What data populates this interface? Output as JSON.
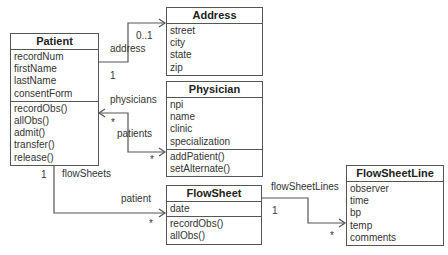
{
  "classes": {
    "patient": {
      "name": "Patient",
      "attributes": [
        "recordNum",
        "firstName",
        "lastName",
        "consentForm"
      ],
      "operations": [
        "recordObs()",
        "allObs()",
        "admit()",
        "transfer()",
        "release()"
      ]
    },
    "address": {
      "name": "Address",
      "attributes": [
        "street",
        "city",
        "state",
        "zip"
      ],
      "operations": []
    },
    "physician": {
      "name": "Physician",
      "attributes": [
        "npi",
        "name",
        "clinic",
        "specialization"
      ],
      "operations": [
        "addPatient()",
        "setAlternate()"
      ]
    },
    "flowsheet": {
      "name": "FlowSheet",
      "attributes": [
        "date"
      ],
      "operations": [
        "recordObs()",
        "allObs()"
      ]
    },
    "flowsheetline": {
      "name": "FlowSheetLine",
      "attributes": [
        "observer",
        "time",
        "bp",
        "temp",
        "comments"
      ],
      "operations": []
    }
  },
  "associations": {
    "patient_address": {
      "role": "address",
      "mult_target": "0..1",
      "mult_source": "1"
    },
    "patient_physician": {
      "role_to_patient": "physicians",
      "role_to_physician": "patients",
      "mult_patient_side": "*",
      "mult_physician_side": "*"
    },
    "patient_flowsheet": {
      "role_to_patient": "flowSheets",
      "role_to_flowsheet": "patient",
      "mult_patient_side": "1",
      "mult_flowsheet_side": "*"
    },
    "flowsheet_line": {
      "role": "flowSheetLines",
      "mult_source": "1",
      "mult_target": "*"
    }
  },
  "colors": {
    "line": "#555555",
    "text": "#333333",
    "background": "#ffffff"
  }
}
